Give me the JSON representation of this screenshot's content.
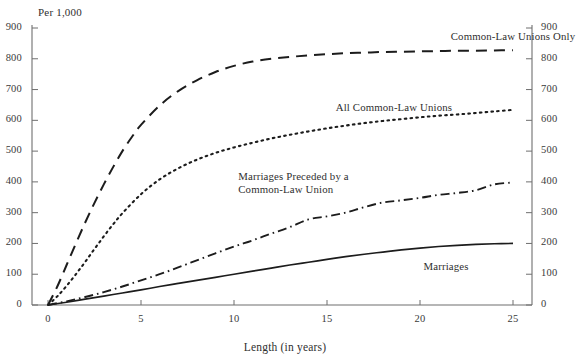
{
  "chart_data": {
    "type": "line",
    "title": "",
    "xlabel": "Length (in years)",
    "ylabel": "Per 1,000",
    "unit_note": "Per 1,000",
    "xlim": [
      0,
      26.5
    ],
    "ylim": [
      0,
      900
    ],
    "grid": false,
    "legend_position": "inline-annotations",
    "x_ticks": [
      "0",
      "5",
      "10",
      "15",
      "20",
      "25"
    ],
    "x_tick_values": [
      0,
      5,
      10,
      15,
      20,
      25
    ],
    "y_ticks": [
      "0",
      "100",
      "200",
      "300",
      "400",
      "500",
      "600",
      "700",
      "800",
      "900"
    ],
    "y_tick_values": [
      0,
      100,
      200,
      300,
      400,
      500,
      600,
      700,
      800,
      900
    ],
    "y_ticks_right": [
      "0",
      "100",
      "200",
      "300",
      "400",
      "500",
      "600",
      "700",
      "800",
      "900"
    ],
    "series": [
      {
        "name": "Common-Law Unions Only",
        "style": "dashed",
        "color": "#1c1c1c",
        "label_x": 25.0,
        "label_y": 868,
        "x": [
          0,
          0.5,
          1,
          1.5,
          2,
          2.5,
          3,
          3.5,
          4,
          4.5,
          5,
          6,
          7,
          8,
          9,
          10,
          11,
          12,
          13,
          14,
          15,
          16,
          17,
          18,
          19,
          20,
          21,
          22,
          23,
          24,
          25
        ],
        "values": [
          0,
          60,
          130,
          200,
          268,
          332,
          392,
          448,
          500,
          545,
          585,
          648,
          695,
          730,
          757,
          777,
          791,
          800,
          806,
          811,
          815,
          818,
          820,
          822,
          823,
          824,
          825,
          826,
          826,
          827,
          828
        ]
      },
      {
        "name": "All Common-Law Unions",
        "style": "dotted",
        "color": "#1c1c1c",
        "label_x": 18.6,
        "label_y": 636,
        "x": [
          0,
          0.5,
          1,
          1.5,
          2,
          2.5,
          3,
          3.5,
          4,
          5,
          6,
          7,
          8,
          9,
          10,
          11,
          12,
          13,
          14,
          15,
          16,
          17,
          18,
          19,
          20,
          21,
          22,
          23,
          24,
          25
        ],
        "values": [
          0,
          28,
          62,
          100,
          140,
          182,
          223,
          262,
          298,
          360,
          408,
          444,
          472,
          494,
          512,
          527,
          541,
          553,
          564,
          574,
          583,
          591,
          598,
          604,
          610,
          615,
          619,
          624,
          629,
          634
        ]
      },
      {
        "name": "Marriages Preceded by a Common-Law Union",
        "label_line1": "Marriages Preceded by a",
        "label_line2": "Common-Law Union",
        "style": "dash-dot",
        "color": "#1c1c1c",
        "label_x": 13.2,
        "label_y": 392,
        "x": [
          0,
          1,
          2,
          3,
          4,
          5,
          6,
          7,
          8,
          9,
          10,
          11,
          12,
          13,
          14,
          15,
          16,
          17,
          18,
          19,
          20,
          21,
          22,
          23,
          24,
          25
        ],
        "values": [
          0,
          12,
          26,
          42,
          60,
          80,
          100,
          122,
          145,
          168,
          190,
          210,
          232,
          253,
          278,
          288,
          300,
          318,
          333,
          340,
          348,
          358,
          364,
          373,
          392,
          398
        ]
      },
      {
        "name": "Marriages",
        "style": "solid",
        "color": "#1c1c1c",
        "label_x": 21.4,
        "label_y": 120,
        "x": [
          0,
          1,
          2,
          3,
          4,
          5,
          6,
          7,
          8,
          9,
          10,
          11,
          12,
          13,
          14,
          15,
          16,
          17,
          18,
          19,
          20,
          21,
          22,
          23,
          24,
          25
        ],
        "values": [
          0,
          9,
          19,
          29,
          39,
          49,
          60,
          70,
          80,
          90,
          100,
          110,
          120,
          130,
          139,
          148,
          157,
          165,
          172,
          179,
          185,
          190,
          194,
          197,
          199,
          200
        ]
      }
    ]
  },
  "axis": {
    "left_unit": "Per 1,000",
    "x_title": "Length (in years)"
  },
  "colors": {
    "ink": "#1c1c1c",
    "axis": "#6f6f6f",
    "text": "#2f2f2f",
    "background": "#ffffff"
  }
}
